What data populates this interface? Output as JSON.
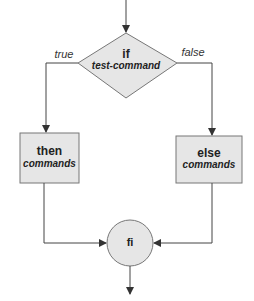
{
  "diagram": {
    "type": "flowchart",
    "colors": {
      "fill": "#e6e6e6",
      "stroke": "#555555",
      "text": "#222222"
    },
    "nodes": {
      "if": {
        "shape": "diamond",
        "keyword": "if",
        "sub": "test-command"
      },
      "then": {
        "shape": "rectangle",
        "keyword": "then",
        "sub": "commands"
      },
      "else": {
        "shape": "rectangle",
        "keyword": "else",
        "sub": "commands"
      },
      "fi": {
        "shape": "circle",
        "keyword": "fi"
      }
    },
    "edges": {
      "true_label": "true",
      "false_label": "false"
    }
  }
}
